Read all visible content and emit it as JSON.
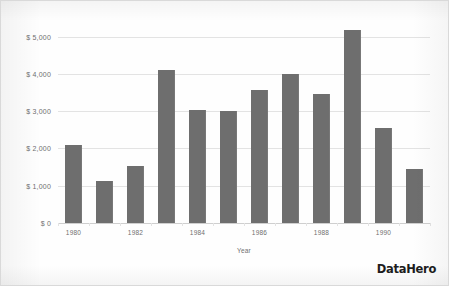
{
  "chart_data": {
    "type": "bar",
    "title": "",
    "subtitle": "",
    "xlabel": "Year",
    "ylabel": "",
    "categories": [
      "1980",
      "1981",
      "1982",
      "1983",
      "1984",
      "1985",
      "1986",
      "1987",
      "1988",
      "1989",
      "1990",
      "1991"
    ],
    "values": [
      2100,
      1130,
      1530,
      4100,
      3030,
      3010,
      3570,
      4000,
      3460,
      5180,
      2540,
      1450
    ],
    "series": [
      {
        "name": "",
        "values": [
          2100,
          1130,
          1530,
          4100,
          3030,
          3010,
          3570,
          4000,
          3460,
          5180,
          2540,
          1450
        ]
      }
    ],
    "ylim": [
      0,
      5500
    ],
    "yticks": [
      0,
      1000,
      2000,
      3000,
      4000,
      5000
    ],
    "ytick_labels": [
      "$ 0",
      "$ 1,000",
      "$ 2,000",
      "$ 3,000",
      "$ 4,000",
      "$ 5,000"
    ],
    "xtick_labels_shown": [
      "1980",
      "1982",
      "1984",
      "1986",
      "1988",
      "1990"
    ],
    "grid": true,
    "legend": false,
    "legend_position": "none",
    "bar_color": "#6e6e6e",
    "grid_color": "#e3e3e3",
    "axis_text_color": "#6f6f6f",
    "background": "#fefefe"
  },
  "branding": {
    "logo_text": "DataHero"
  },
  "axis": {
    "x_title": "Year"
  }
}
